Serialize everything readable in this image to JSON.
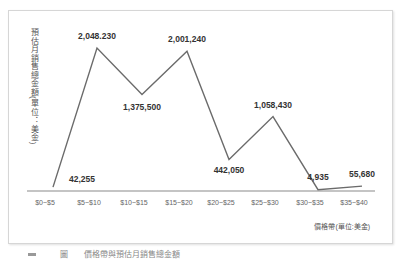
{
  "chart_data": {
    "type": "line",
    "title": "",
    "xlabel": "價格帶(單位:美金)",
    "ylabel": "預估月銷售總金額(單位：美金)",
    "categories": [
      "$0~$5",
      "$5~$10",
      "$10~$15",
      "$15~$20",
      "$20~$25",
      "$25~$30",
      "$30~$35",
      "$35~$40"
    ],
    "series": [
      {
        "name": "預估月銷售總金額",
        "values": [
          42255,
          2048230,
          1375500,
          2001240,
          442050,
          1058430,
          4935,
          55680
        ]
      }
    ],
    "data_labels": [
      "42,255",
      "2,048.230",
      "1,375,500",
      "2,001,240",
      "442,050",
      "1,058,430",
      "4,935",
      "55,680"
    ],
    "grid": false,
    "legend": "none",
    "line_color": "#6b6b6b"
  },
  "labels": {
    "x_axis_title": "價格帶(單位:美金)",
    "y_axis_title": "預估月銷售總金額(單位：美金)",
    "caption": "圖　　價格帶與預估月銷售總金額"
  }
}
